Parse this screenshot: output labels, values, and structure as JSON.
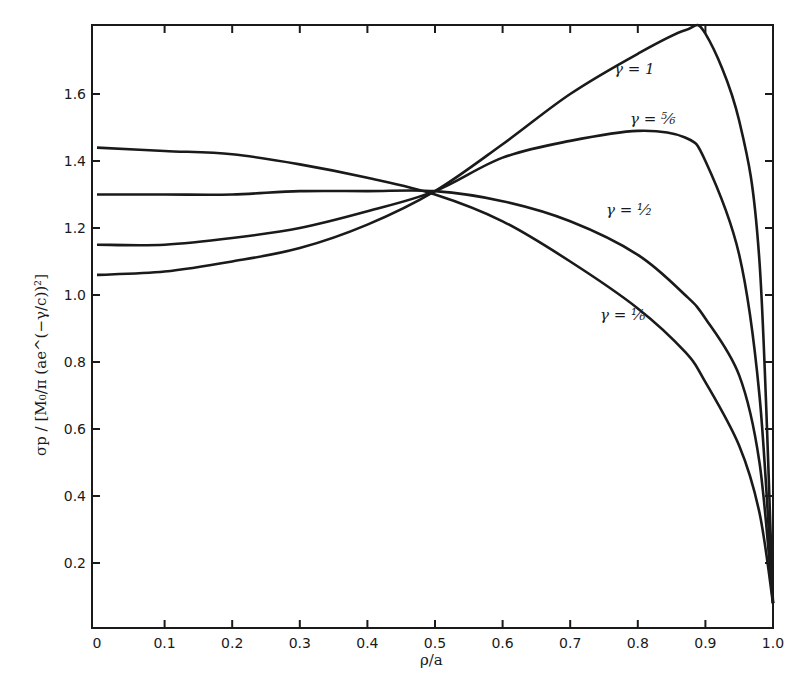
{
  "chart_data": {
    "type": "line",
    "title": "",
    "xlabel": "ρ/a",
    "ylabel": "σp / [M₀ / π (a e^(−γ/c))²]",
    "xlim": [
      0,
      1.0
    ],
    "ylim": [
      0,
      1.8
    ],
    "grid": false,
    "legend_position": "inline labels",
    "x_ticks": [
      "0",
      "0.1",
      "0.2",
      "0.3",
      "0.4",
      "0.5",
      "0.6",
      "0.7",
      "0.8",
      "0.9",
      "1.0"
    ],
    "y_ticks": [
      "0.2",
      "0.4",
      "0.6",
      "0.8",
      "1.0",
      "1.2",
      "1.4",
      "1.6"
    ],
    "x": [
      0,
      0.1,
      0.2,
      0.3,
      0.4,
      0.5,
      0.6,
      0.7,
      0.8,
      0.87,
      0.9,
      0.95,
      0.98,
      1.0
    ],
    "series": [
      {
        "name": "γ = 1",
        "label": "γ=1",
        "values": [
          1.06,
          1.07,
          1.1,
          1.14,
          1.21,
          1.31,
          1.45,
          1.6,
          1.72,
          1.79,
          1.78,
          1.52,
          1.1,
          0.08
        ]
      },
      {
        "name": "γ = 5/6",
        "label": "γ=5/6",
        "values": [
          1.15,
          1.15,
          1.17,
          1.2,
          1.25,
          1.31,
          1.41,
          1.46,
          1.49,
          1.47,
          1.4,
          1.12,
          0.7,
          0.08
        ]
      },
      {
        "name": "γ = 1/2",
        "label": "γ=1/2",
        "values": [
          1.3,
          1.3,
          1.3,
          1.31,
          1.31,
          1.31,
          1.28,
          1.22,
          1.12,
          1.0,
          0.93,
          0.76,
          0.5,
          0.08
        ]
      },
      {
        "name": "γ = 1/6",
        "label": "γ=1/6",
        "values": [
          1.44,
          1.43,
          1.42,
          1.39,
          1.35,
          1.3,
          1.22,
          1.1,
          0.96,
          0.83,
          0.74,
          0.55,
          0.35,
          0.08
        ]
      }
    ]
  },
  "labels": {
    "gamma_1": "γ = 1",
    "gamma_5_6": "γ = ⁵⁄₆",
    "gamma_1_2": "γ = ¹⁄₂",
    "gamma_1_6": "γ = ¹⁄₆",
    "xlabel": "ρ/a",
    "ylabel": "σp / [M₀/π (ae^(−γ/c))²]"
  },
  "colors": {
    "line": "#1a1a1a",
    "background": "#ffffff"
  }
}
